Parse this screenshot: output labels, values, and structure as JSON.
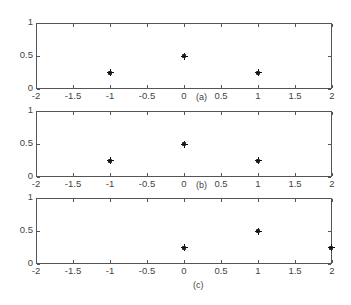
{
  "chart_data": [
    {
      "type": "scatter",
      "title": "",
      "caption": "(a)",
      "marker": "*",
      "x": [
        -1,
        0,
        1
      ],
      "y": [
        0.25,
        0.5,
        0.25
      ],
      "xlim": [
        -2,
        2
      ],
      "ylim": [
        0,
        1
      ],
      "xticks": [
        "-2",
        "-1.5",
        "-1",
        "-0.5",
        "0",
        "0.5",
        "1",
        "1.5",
        "2"
      ],
      "yticks": [
        "0",
        "0.5",
        "1"
      ],
      "grid": false
    },
    {
      "type": "scatter",
      "title": "",
      "caption": "(b)",
      "marker": "*",
      "x": [
        -1,
        0,
        1
      ],
      "y": [
        0.25,
        0.5,
        0.25
      ],
      "xlim": [
        -2,
        2
      ],
      "ylim": [
        0,
        1
      ],
      "xticks": [
        "-2",
        "-1.5",
        "-1",
        "-0.5",
        "0",
        "0.5",
        "1",
        "1.5",
        "2"
      ],
      "yticks": [
        "0",
        "0.5",
        "1"
      ],
      "grid": false
    },
    {
      "type": "scatter",
      "title": "",
      "caption": "(c)",
      "marker": "*",
      "x": [
        0,
        1,
        2
      ],
      "y": [
        0.25,
        0.5,
        0.25
      ],
      "xlim": [
        -2,
        2
      ],
      "ylim": [
        0,
        1
      ],
      "xticks": [
        "-2",
        "-1.5",
        "-1",
        "-0.5",
        "0",
        "0.5",
        "1",
        "1.5",
        "2"
      ],
      "yticks": [
        "0",
        "0.5",
        "1"
      ],
      "grid": false
    }
  ]
}
